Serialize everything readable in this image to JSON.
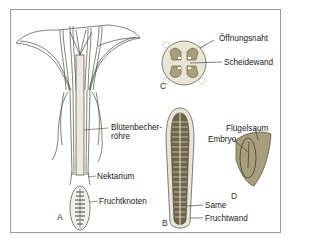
{
  "figure": {
    "panels": [
      {
        "id": "A",
        "letter": "A",
        "subject": "flower longitudinal section",
        "labels": [
          "Blütenbecher-\nröhre",
          "Nektarium",
          "Fruchtknoten"
        ]
      },
      {
        "id": "B",
        "letter": "B",
        "subject": "fruit longitudinal section",
        "labels": [
          "Same",
          "Fruchtwand"
        ]
      },
      {
        "id": "C",
        "letter": "C",
        "subject": "fruit cross-section",
        "labels": [
          "Öffnungsnaht",
          "Scheidewand"
        ]
      },
      {
        "id": "D",
        "letter": "D",
        "subject": "winged seed",
        "labels": [
          "Flügelsaum",
          "Embryo"
        ]
      }
    ]
  },
  "labels": {
    "bluetenbecher_line1": "Blütenbecher-",
    "bluetenbecher_line2": "röhre",
    "nektarium": "Nektarium",
    "fruchtknoten": "Fruchtknoten",
    "oeffnungsnaht": "Öffnungsnaht",
    "scheidewand": "Scheidewand",
    "fluegelsaum": "Flügelsaum",
    "embryo": "Embryo",
    "same": "Same",
    "fruchtwand": "Fruchtwand"
  },
  "letters": {
    "a": "A",
    "b": "B",
    "c": "C",
    "d": "D"
  },
  "colors": {
    "frame": "#9a9a9a",
    "line": "#4a4a44",
    "fill_light": "#e8e4d6",
    "seed_fill": "#a89e7c",
    "seed_dark": "#6e6548",
    "text": "#222222"
  }
}
